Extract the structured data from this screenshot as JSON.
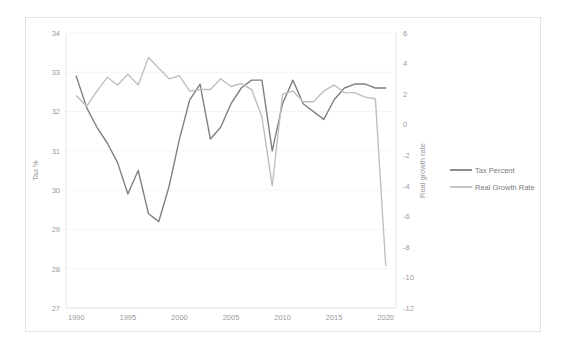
{
  "chart_data": {
    "type": "line",
    "title": "",
    "xlabel": "",
    "ylabel": "Tax %",
    "y2label": "Real growth rate",
    "x": [
      1990,
      1991,
      1992,
      1993,
      1994,
      1995,
      1996,
      1997,
      1998,
      1999,
      2000,
      2001,
      2002,
      2003,
      2004,
      2005,
      2006,
      2007,
      2008,
      2009,
      2010,
      2011,
      2012,
      2013,
      2014,
      2015,
      2016,
      2017,
      2018,
      2019,
      2020
    ],
    "xlim": [
      1989,
      2021
    ],
    "ylim": [
      27,
      34
    ],
    "y2lim": [
      -12,
      6
    ],
    "xticks": [
      1990,
      1995,
      2000,
      2005,
      2010,
      2015,
      2020
    ],
    "yticks": [
      27,
      28,
      29,
      30,
      31,
      32,
      33,
      34
    ],
    "y2ticks": [
      -12,
      -10,
      -8,
      -6,
      -4,
      -2,
      0,
      2,
      4,
      6
    ],
    "grid": true,
    "legend_position": "right",
    "series": [
      {
        "name": "Tax Percent",
        "axis": "left",
        "color": "#808080",
        "values": [
          32.9,
          32.1,
          31.6,
          31.2,
          30.7,
          29.9,
          30.5,
          29.4,
          29.2,
          30.1,
          31.3,
          32.3,
          32.7,
          31.3,
          31.6,
          32.2,
          32.6,
          32.8,
          32.8,
          31.0,
          32.2,
          32.8,
          32.2,
          32.0,
          31.8,
          32.3,
          32.6,
          32.7,
          32.7,
          32.6,
          32.6
        ]
      },
      {
        "name": "Real Growth Rate",
        "axis": "right",
        "color": "#bfbfbf",
        "values": [
          1.9,
          1.2,
          2.2,
          3.1,
          2.6,
          3.3,
          2.6,
          4.4,
          3.7,
          3.0,
          3.2,
          2.2,
          2.3,
          2.3,
          3.0,
          2.5,
          2.7,
          2.3,
          0.5,
          -4.0,
          2.0,
          2.2,
          1.5,
          1.5,
          2.2,
          2.6,
          2.1,
          2.1,
          1.8,
          1.7,
          -9.2
        ]
      }
    ]
  },
  "legend": {
    "items": [
      {
        "label": "Tax Percent",
        "color": "#808080"
      },
      {
        "label": "Real Growth Rate",
        "color": "#bfbfbf"
      }
    ]
  }
}
